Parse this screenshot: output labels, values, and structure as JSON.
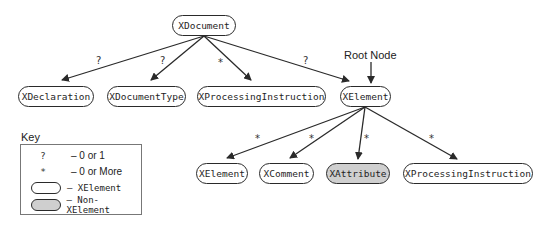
{
  "diagram": {
    "root_label": "Root Node",
    "nodes": {
      "xdocument": "XDocument",
      "xdeclaration": "XDeclaration",
      "xdocumenttype": "XDocumentType",
      "xprocessinginstruction_top": "XProcessingInstruction",
      "xelement_top": "XElement",
      "xelement_child": "XElement",
      "xcomment": "XComment",
      "xattribute": "XAttribute",
      "xprocessinginstruction_child": "XProcessingInstruction"
    },
    "multiplicities": {
      "doc_to_declaration": "?",
      "doc_to_documenttype": "?",
      "doc_to_processinginstruction": "*",
      "doc_to_element": "?",
      "el_to_element": "*",
      "el_to_comment": "*",
      "el_to_attribute": "*",
      "el_to_processinginstruction": "*"
    }
  },
  "key": {
    "title": "Key",
    "rows": [
      {
        "symbol": "?",
        "desc": "– 0 or 1"
      },
      {
        "symbol": "*",
        "desc": "– 0 or More"
      },
      {
        "symbol": "white-pill",
        "desc": "– XElement"
      },
      {
        "symbol": "gray-pill",
        "desc": "– Non-XElement"
      }
    ]
  },
  "colors": {
    "stroke": "#2a2a2a",
    "non_xelement_fill": "#cfcfcf",
    "background": "#ffffff"
  }
}
